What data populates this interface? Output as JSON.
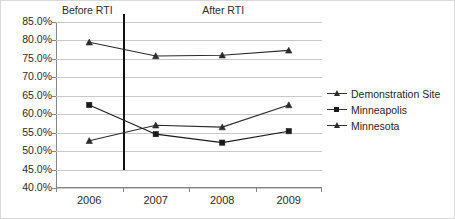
{
  "chart_data": {
    "type": "line",
    "title": "",
    "subtitle": "",
    "xlabel": "",
    "ylabel": "",
    "categories": [
      "2006",
      "2007",
      "2008",
      "2009"
    ],
    "ylim": [
      40.0,
      85.0
    ],
    "ytick_step": 5.0,
    "ytick_labels": [
      "85.0%",
      "80.0%",
      "75.0%",
      "70.0%",
      "65.0%",
      "60.0%",
      "55.0%",
      "50.0%",
      "45.0%",
      "40.0%"
    ],
    "ytick_values": [
      85.0,
      80.0,
      75.0,
      70.0,
      65.0,
      60.0,
      55.0,
      50.0,
      45.0,
      40.0
    ],
    "grid": true,
    "grid_axis": "y",
    "legend_position": "right",
    "series": [
      {
        "name": "Demonstration Site",
        "marker": "triangle",
        "color": "#2b2b2b",
        "values": [
          52.8,
          57.0,
          56.5,
          62.5
        ]
      },
      {
        "name": "Minneapolis",
        "marker": "square",
        "color": "#1a1a1a",
        "values": [
          62.5,
          54.6,
          52.3,
          55.4
        ]
      },
      {
        "name": "Minnesota",
        "marker": "triangle",
        "color": "#2b2b2b",
        "values": [
          79.5,
          75.8,
          76.0,
          77.3
        ]
      }
    ],
    "annotations": [
      {
        "text": "Before RTI",
        "x_category": "2006",
        "kind": "phase-label"
      },
      {
        "text": "After RTI",
        "x_category": "2008",
        "kind": "phase-label"
      },
      {
        "text": "",
        "kind": "vertical-divider",
        "between": [
          "2006",
          "2007"
        ]
      }
    ]
  },
  "annotations": {
    "before_rti": "Before RTI",
    "after_rti": "After RTI"
  },
  "legend": {
    "items": [
      {
        "label": "Demonstration Site"
      },
      {
        "label": "Minneapolis"
      },
      {
        "label": "Minnesota"
      }
    ]
  },
  "colors": {
    "gridline": "#c8c8c8",
    "axis": "#868686",
    "divider": "#111111",
    "text": "#2b2b2b",
    "background": "#ffffff",
    "border": "#d9d9d9"
  }
}
